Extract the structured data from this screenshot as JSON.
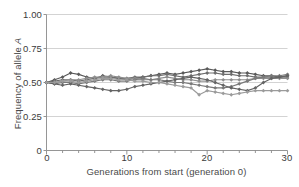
{
  "chart_data": {
    "type": "line",
    "title": "",
    "subtitle": "",
    "xlabel": "Generations from start (generation 0)",
    "ylabel": "Frequency of allele A",
    "xlim": [
      0,
      30
    ],
    "ylim": [
      0,
      1.0
    ],
    "xticks": [
      0,
      10,
      20,
      30
    ],
    "xtick_labels": [
      "0",
      "10",
      "20",
      "30"
    ],
    "yticks": [
      0,
      0.25,
      0.5,
      0.75,
      1.0
    ],
    "ytick_labels": [
      "0",
      "0.25",
      "0.50",
      "0.75",
      "1.00"
    ],
    "minor_xticks_per_major": 5,
    "grid": "horizontal",
    "legend": "none",
    "marker": "diamond",
    "x": [
      0,
      1,
      2,
      3,
      4,
      5,
      6,
      7,
      8,
      9,
      10,
      11,
      12,
      13,
      14,
      15,
      16,
      17,
      18,
      19,
      20,
      21,
      22,
      23,
      24,
      25,
      26,
      27,
      28,
      29,
      30
    ],
    "series": [
      {
        "name": "population-1",
        "color": "#5a5a5a",
        "values": [
          0.5,
          0.52,
          0.54,
          0.57,
          0.56,
          0.54,
          0.53,
          0.55,
          0.54,
          0.53,
          0.52,
          0.53,
          0.54,
          0.55,
          0.56,
          0.57,
          0.56,
          0.57,
          0.58,
          0.59,
          0.6,
          0.59,
          0.58,
          0.58,
          0.57,
          0.57,
          0.56,
          0.55,
          0.55,
          0.54,
          0.55
        ]
      },
      {
        "name": "population-2",
        "color": "#6e6e6e",
        "values": [
          0.5,
          0.51,
          0.52,
          0.52,
          0.51,
          0.52,
          0.53,
          0.54,
          0.54,
          0.53,
          0.53,
          0.54,
          0.54,
          0.55,
          0.55,
          0.56,
          0.55,
          0.54,
          0.55,
          0.56,
          0.57,
          0.57,
          0.56,
          0.56,
          0.55,
          0.55,
          0.54,
          0.54,
          0.54,
          0.54,
          0.54
        ]
      },
      {
        "name": "population-3",
        "color": "#8f8f8f",
        "values": [
          0.5,
          0.5,
          0.51,
          0.52,
          0.52,
          0.53,
          0.54,
          0.54,
          0.55,
          0.54,
          0.53,
          0.53,
          0.52,
          0.52,
          0.53,
          0.54,
          0.53,
          0.52,
          0.52,
          0.51,
          0.51,
          0.52,
          0.52,
          0.52,
          0.52,
          0.52,
          0.53,
          0.53,
          0.53,
          0.53,
          0.53
        ]
      },
      {
        "name": "population-4",
        "color": "#7a7a7a",
        "values": [
          0.5,
          0.49,
          0.5,
          0.5,
          0.49,
          0.5,
          0.51,
          0.52,
          0.52,
          0.51,
          0.51,
          0.52,
          0.53,
          0.52,
          0.52,
          0.51,
          0.5,
          0.5,
          0.49,
          0.48,
          0.47,
          0.46,
          0.46,
          0.47,
          0.49,
          0.51,
          0.53,
          0.54,
          0.55,
          0.55,
          0.56
        ]
      },
      {
        "name": "population-5",
        "color": "#646464",
        "values": [
          0.5,
          0.49,
          0.48,
          0.49,
          0.48,
          0.47,
          0.46,
          0.45,
          0.44,
          0.44,
          0.45,
          0.47,
          0.48,
          0.49,
          0.5,
          0.51,
          0.52,
          0.53,
          0.54,
          0.53,
          0.52,
          0.5,
          0.48,
          0.46,
          0.45,
          0.44,
          0.46,
          0.5,
          0.53,
          0.54,
          0.55
        ]
      },
      {
        "name": "population-6",
        "color": "#9b9b9b",
        "values": [
          0.5,
          0.5,
          0.51,
          0.51,
          0.5,
          0.51,
          0.52,
          0.53,
          0.53,
          0.52,
          0.52,
          0.51,
          0.51,
          0.5,
          0.5,
          0.49,
          0.48,
          0.47,
          0.46,
          0.41,
          0.44,
          0.43,
          0.42,
          0.41,
          0.42,
          0.43,
          0.44,
          0.44,
          0.44,
          0.44,
          0.44
        ]
      }
    ]
  },
  "axes": {
    "y_title": "Frequency of allele ",
    "y_title_italic": "A",
    "x_title": "Generations from start (generation 0)"
  },
  "colors": {
    "grid": "#c8c8c8",
    "axis": "#8a8a8a",
    "text": "#3b3b3b",
    "label": "#4a4a4a",
    "background": "#ffffff"
  }
}
